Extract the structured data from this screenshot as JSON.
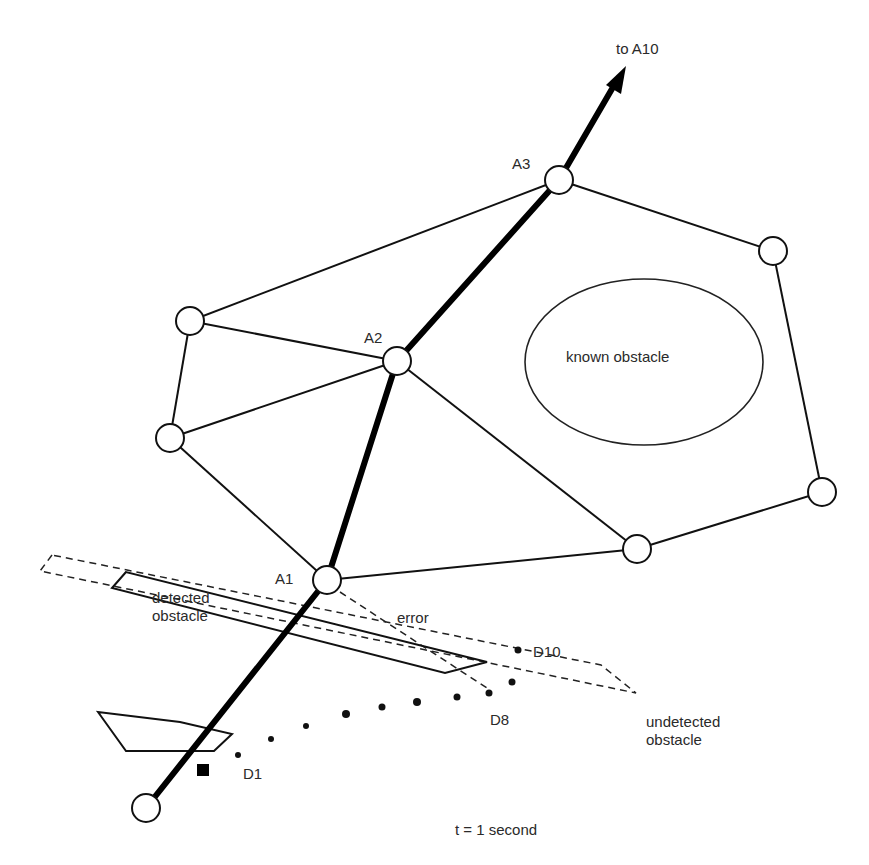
{
  "diagram": {
    "labels": {
      "to_a10": "to A10",
      "a3": "A3",
      "a2": "A2",
      "a1": "A1",
      "known_obstacle": "known obstacle",
      "detected_obstacle_line1": "detected",
      "detected_obstacle_line2": "obstacle",
      "error": "error",
      "d10": "D10",
      "d8": "D8",
      "d1": "D1",
      "undetected_obstacle_line1": "undetected",
      "undetected_obstacle_line2": "obstacle",
      "time": "t = 1 second"
    },
    "nodes": [
      {
        "id": "start",
        "x": 146,
        "y": 808
      },
      {
        "id": "A1",
        "x": 327,
        "y": 580
      },
      {
        "id": "A2",
        "x": 397,
        "y": 361
      },
      {
        "id": "A3",
        "x": 559,
        "y": 180
      },
      {
        "id": "left-top",
        "x": 190,
        "y": 321
      },
      {
        "id": "left-mid",
        "x": 170,
        "y": 438
      },
      {
        "id": "right-top",
        "x": 773,
        "y": 251
      },
      {
        "id": "right-low",
        "x": 822,
        "y": 492
      },
      {
        "id": "bottom-right",
        "x": 637,
        "y": 549
      }
    ],
    "edges": [
      [
        "A3",
        "left-top"
      ],
      [
        "A3",
        "right-top"
      ],
      [
        "left-top",
        "A2"
      ],
      [
        "left-top",
        "left-mid"
      ],
      [
        "left-mid",
        "A2"
      ],
      [
        "left-mid",
        "A1"
      ],
      [
        "A2",
        "bottom-right"
      ],
      [
        "right-top",
        "right-low"
      ],
      [
        "right-low",
        "bottom-right"
      ],
      [
        "bottom-right",
        "A1"
      ]
    ],
    "path": [
      "start",
      "A1",
      "A2",
      "A3",
      "to A10"
    ],
    "detection_points": [
      "D1",
      "D2",
      "D3",
      "D4",
      "D5",
      "D6",
      "D7",
      "D8",
      "D9",
      "D10"
    ],
    "colors": {
      "ink": "#111111",
      "background": "#ffffff"
    }
  }
}
